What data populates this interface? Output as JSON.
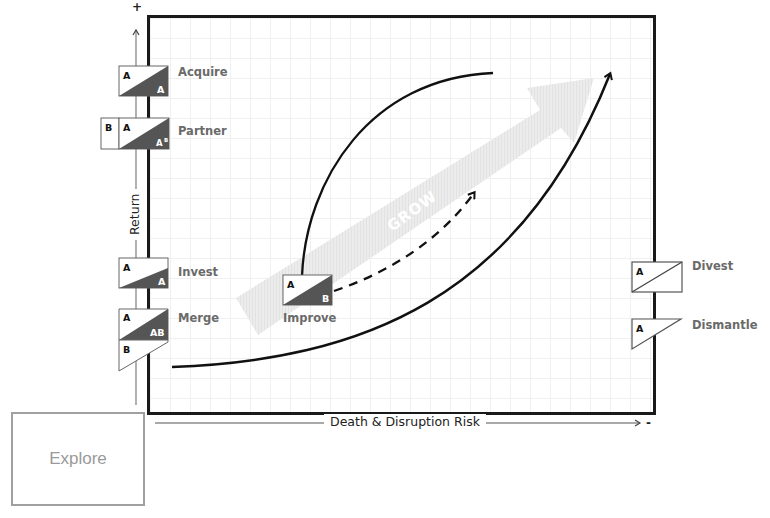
{
  "diagram": {
    "title": "",
    "y_axis": {
      "label": "Return",
      "positive_marker": "+"
    },
    "x_axis": {
      "label": "Death & Disruption Risk",
      "negative_marker": "-"
    },
    "center_arrow": {
      "label": "GROW"
    },
    "explore_box": {
      "label": "Explore"
    },
    "strategies": [
      {
        "id": "acquire",
        "label": "Acquire",
        "top_letter": "A",
        "bottom_letter": "A",
        "extra_letter": ""
      },
      {
        "id": "partner",
        "label": "Partner",
        "top_letter": "A",
        "bottom_letter": "AB",
        "extra_letter": "B"
      },
      {
        "id": "invest",
        "label": "Invest",
        "top_letter": "A",
        "bottom_letter": "A",
        "extra_letter": ""
      },
      {
        "id": "merge",
        "label": "Merge",
        "top_letter": "A",
        "bottom_letter": "AB",
        "extra_letter": "B"
      },
      {
        "id": "improve",
        "label": "Improve",
        "top_letter": "A",
        "bottom_letter": "B",
        "extra_letter": ""
      },
      {
        "id": "divest",
        "label": "Divest",
        "top_letter": "A",
        "bottom_letter": "",
        "extra_letter": ""
      },
      {
        "id": "dismantle",
        "label": "Dismantle",
        "top_letter": "A",
        "bottom_letter": "",
        "extra_letter": ""
      }
    ],
    "colors": {
      "frame": "#1a1a1a",
      "dark_fill": "#555555",
      "label_gray": "#6a6a6a",
      "grow_arrow": "#ececec",
      "explore_border": "#a0a0a0",
      "axis_gray": "#888888"
    }
  }
}
